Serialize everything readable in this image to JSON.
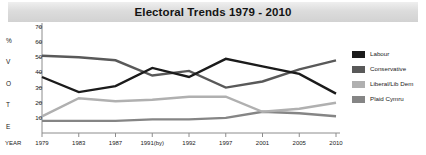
{
  "chart_data": {
    "type": "line",
    "title": "Electoral Trends 1979 - 2010",
    "xlabel": "YEAR",
    "ylabel": "% VOTE",
    "ylabel_letters": [
      "%",
      "V",
      "O",
      "T",
      "E"
    ],
    "categories": [
      "1979",
      "1983",
      "1987",
      "1991(by)",
      "1992",
      "1997",
      "2001",
      "2005",
      "2010"
    ],
    "yticks": [
      10,
      20,
      30,
      40,
      50,
      60,
      70
    ],
    "ylim": [
      0,
      70
    ],
    "grid": false,
    "legend_position": "right",
    "series": [
      {
        "name": "Labour",
        "color": "#1b1b1b",
        "values": [
          37,
          27,
          31,
          43,
          37,
          49,
          44,
          39,
          26
        ]
      },
      {
        "name": "Conservative",
        "color": "#595959",
        "values": [
          51,
          50,
          48,
          38,
          41,
          30,
          34,
          42,
          48
        ]
      },
      {
        "name": "Liberal/Lib Dem",
        "color": "#b0b0b0",
        "values": [
          11,
          23,
          21,
          22,
          24,
          24,
          14,
          16,
          20
        ]
      },
      {
        "name": "Plaid Cymru",
        "color": "#858585",
        "values": [
          8,
          8,
          8,
          9,
          9,
          10,
          14,
          13,
          11
        ]
      }
    ]
  },
  "legend": {
    "items": [
      {
        "label": "Labour"
      },
      {
        "label": "Conservative"
      },
      {
        "label": "Liberal/Lib Dem"
      },
      {
        "label": "Plaid Cymru"
      }
    ]
  }
}
